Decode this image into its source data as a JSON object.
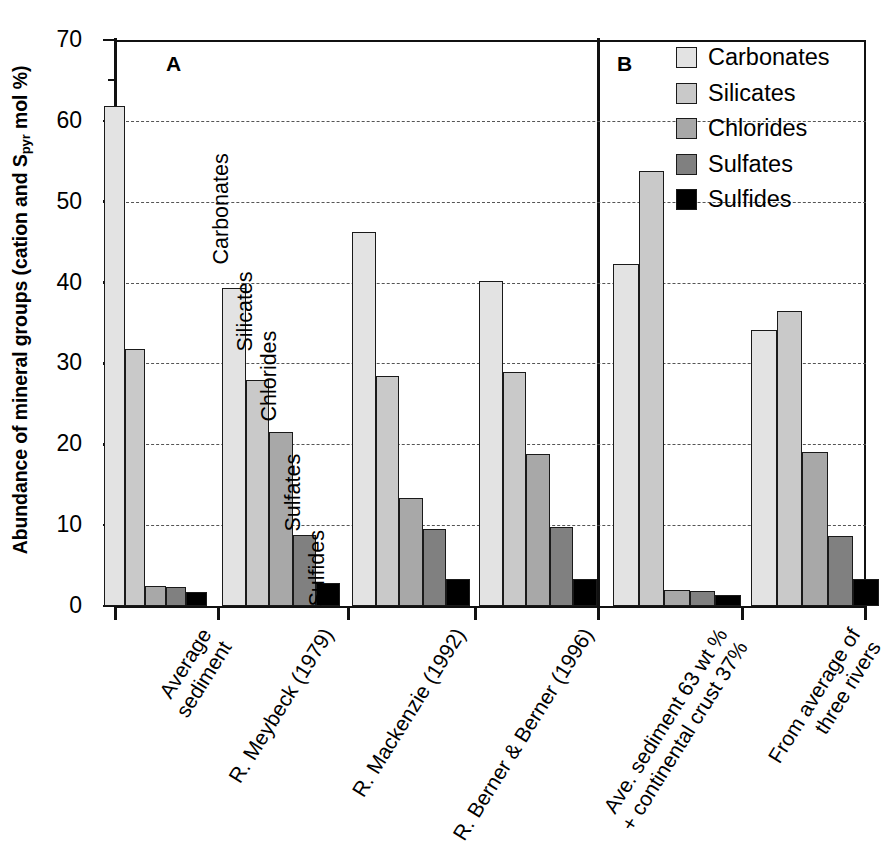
{
  "chart_data": {
    "type": "bar",
    "title": "",
    "xlabel": "",
    "ylabel": "Abundance of mineral groups (cation and Spyr mol %)",
    "ylabel_parts": {
      "pre": "Abundance of mineral groups (cation and S",
      "sub": "pyr",
      "post": " mol %)"
    },
    "ylim": [
      0,
      70
    ],
    "yticks": [
      0,
      10,
      20,
      30,
      40,
      50,
      60,
      70
    ],
    "yticks_minor": [
      5,
      15,
      25,
      35,
      45,
      55,
      65
    ],
    "ytick_labels": [
      "0",
      "10",
      "20",
      "30",
      "40",
      "50",
      "60",
      "70"
    ],
    "grid": "horizontal-dashed",
    "legend_position": "top-right",
    "panels": [
      "A",
      "B"
    ],
    "categories": [
      "Average sediment",
      "R. Meybeck (1979)",
      "R. Mackenzie (1992)",
      "R. Berner & Berner (1996)",
      "Ave. sediment 63 wt % + continental crust 37%",
      "From average of three rivers"
    ],
    "category_lines": [
      [
        "Average",
        "sediment"
      ],
      [
        "R. Meybeck (1979)"
      ],
      [
        "R. Mackenzie (1992)"
      ],
      [
        "R. Berner & Berner (1996)"
      ],
      [
        "Ave. sediment 63 wt %",
        "+ continental crust 37%"
      ],
      [
        "From average of",
        "three rivers"
      ]
    ],
    "series": [
      {
        "name": "Carbonates",
        "color": "#e3e3e3",
        "values": [
          61.8,
          39.3,
          46.2,
          40.2,
          42.3,
          34.1
        ]
      },
      {
        "name": "Silicates",
        "color": "#c9c9c9",
        "values": [
          31.8,
          28.0,
          28.5,
          28.9,
          53.8,
          36.5
        ]
      },
      {
        "name": "Chlorides",
        "color": "#a8a8a8",
        "values": [
          2.5,
          21.5,
          13.3,
          18.8,
          2.0,
          19.0
        ]
      },
      {
        "name": "Sulfates",
        "color": "#808080",
        "values": [
          2.3,
          8.8,
          9.5,
          9.8,
          1.8,
          8.6
        ]
      },
      {
        "name": "Sulfides",
        "color": "#000000",
        "values": [
          1.7,
          2.8,
          3.3,
          3.3,
          1.3,
          3.3
        ]
      }
    ],
    "annotations": [
      {
        "text": "Carbonates",
        "for": "Carbonates"
      },
      {
        "text": "Silicates",
        "for": "Silicates"
      },
      {
        "text": "Chlorides",
        "for": "Chlorides"
      },
      {
        "text": "Sulfates",
        "for": "Sulfates"
      },
      {
        "text": "Sulfides",
        "for": "Sulfides"
      }
    ]
  },
  "legend": {
    "items": [
      {
        "label": "Carbonates",
        "color": "#e3e3e3"
      },
      {
        "label": "Silicates",
        "color": "#c9c9c9"
      },
      {
        "label": "Chlorides",
        "color": "#a8a8a8"
      },
      {
        "label": "Sulfates",
        "color": "#808080"
      },
      {
        "label": "Sulfides",
        "color": "#000000"
      }
    ]
  },
  "panel_labels": {
    "a": "A",
    "b": "B"
  }
}
